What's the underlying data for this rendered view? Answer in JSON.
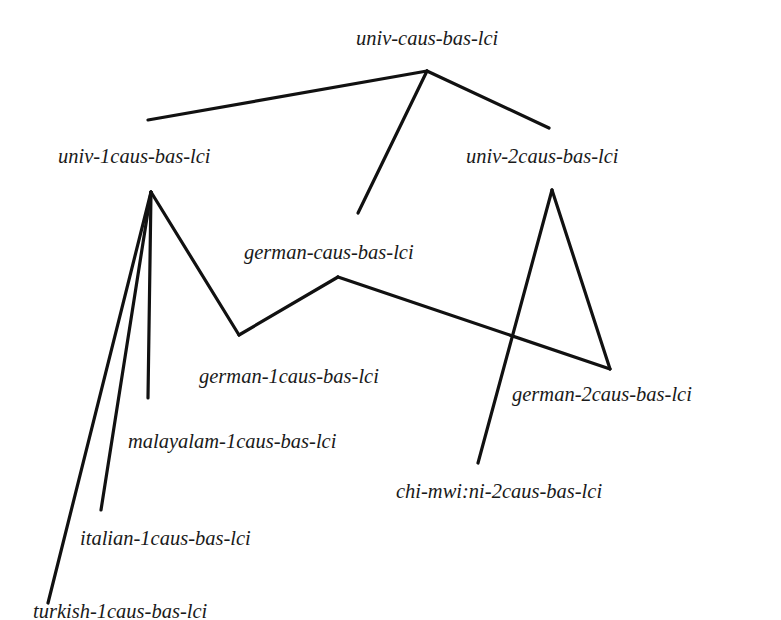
{
  "diagram": {
    "type": "hierarchy",
    "line_color": "#111111",
    "nodes": [
      {
        "id": "univ-caus",
        "label": "univ-caus-bas-lci",
        "x": 356,
        "y": 28
      },
      {
        "id": "univ-1caus",
        "label": "univ-1caus-bas-lci",
        "x": 58,
        "y": 146
      },
      {
        "id": "univ-2caus",
        "label": "univ-2caus-bas-lci",
        "x": 466,
        "y": 146
      },
      {
        "id": "german-caus",
        "label": "german-caus-bas-lci",
        "x": 244,
        "y": 242
      },
      {
        "id": "german-1caus",
        "label": "german-1caus-bas-lci",
        "x": 199,
        "y": 366
      },
      {
        "id": "german-2caus",
        "label": "german-2caus-bas-lci",
        "x": 512,
        "y": 384
      },
      {
        "id": "malayalam-1caus",
        "label": "malayalam-1caus-bas-lci",
        "x": 128,
        "y": 431
      },
      {
        "id": "chi-mwini-2caus",
        "label": "chi-mwi:ni-2caus-bas-lci",
        "x": 396,
        "y": 481
      },
      {
        "id": "italian-1caus",
        "label": "italian-1caus-bas-lci",
        "x": 80,
        "y": 528
      },
      {
        "id": "turkish-1caus",
        "label": "turkish-1caus-bas-lci",
        "x": 33,
        "y": 601
      }
    ],
    "edges": [
      {
        "from": "univ-caus",
        "to": "univ-1caus",
        "x1": 427,
        "y1": 71,
        "x2": 148,
        "y2": 120
      },
      {
        "from": "univ-caus",
        "to": "german-caus",
        "x1": 427,
        "y1": 71,
        "x2": 358,
        "y2": 213
      },
      {
        "from": "univ-caus",
        "to": "univ-2caus",
        "x1": 427,
        "y1": 71,
        "x2": 549,
        "y2": 128
      },
      {
        "from": "univ-1caus",
        "to": "turkish-1caus",
        "x1": 151,
        "y1": 192,
        "x2": 48,
        "y2": 603
      },
      {
        "from": "univ-1caus",
        "to": "italian-1caus",
        "x1": 151,
        "y1": 192,
        "x2": 101,
        "y2": 510
      },
      {
        "from": "univ-1caus",
        "to": "malayalam-1caus",
        "x1": 151,
        "y1": 192,
        "x2": 148,
        "y2": 398
      },
      {
        "from": "univ-1caus",
        "to": "german-1caus",
        "x1": 151,
        "y1": 192,
        "x2": 239,
        "y2": 335
      },
      {
        "from": "german-caus",
        "to": "german-1caus",
        "x1": 338,
        "y1": 277,
        "x2": 239,
        "y2": 335
      },
      {
        "from": "german-caus",
        "to": "german-2caus",
        "x1": 338,
        "y1": 277,
        "x2": 610,
        "y2": 369
      },
      {
        "from": "univ-2caus",
        "to": "german-2caus",
        "x1": 552,
        "y1": 190,
        "x2": 610,
        "y2": 369
      },
      {
        "from": "univ-2caus",
        "to": "chi-mwini-2caus",
        "x1": 552,
        "y1": 190,
        "x2": 478,
        "y2": 463
      }
    ]
  }
}
